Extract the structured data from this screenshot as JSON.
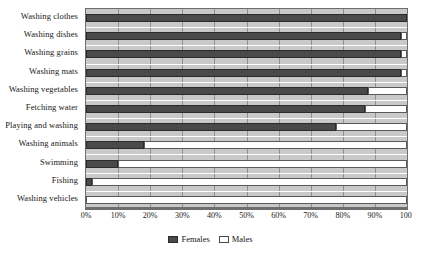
{
  "chart_data": {
    "type": "bar",
    "orientation": "horizontal",
    "stacked": true,
    "title": "",
    "xlabel": "",
    "ylabel": "",
    "xlim": [
      0,
      100
    ],
    "grid": true,
    "legend_position": "bottom-center",
    "categories": [
      "Washing clothes",
      "Washing dishes",
      "Washing grains",
      "Washing mats",
      "Washing vegetables",
      "Fetching water",
      "Playing and washing",
      "Washing animals",
      "Swimming",
      "Fishing",
      "Washing vehicles"
    ],
    "xticks": [
      "0%",
      "10%",
      "20%",
      "30%",
      "40%",
      "50%",
      "60%",
      "70%",
      "80%",
      "90%",
      "100"
    ],
    "xtick_values": [
      0,
      10,
      20,
      30,
      40,
      50,
      60,
      70,
      80,
      90,
      100
    ],
    "series": [
      {
        "name": "Females",
        "color": "#4a4a4a",
        "values": [
          100,
          98,
          98,
          98,
          88,
          87,
          78,
          18,
          10,
          2,
          0
        ]
      },
      {
        "name": "Males",
        "color": "#ffffff",
        "values": [
          0,
          2,
          2,
          2,
          12,
          13,
          22,
          82,
          90,
          98,
          100
        ]
      }
    ]
  },
  "legend": {
    "females_label": "Females",
    "males_label": "Males"
  },
  "colors": {
    "females": "#4a4a4a",
    "males": "#ffffff",
    "plot_background": "#c9c9c9",
    "gridline": "#8f8f8f",
    "axis": "#6e6e6e"
  }
}
